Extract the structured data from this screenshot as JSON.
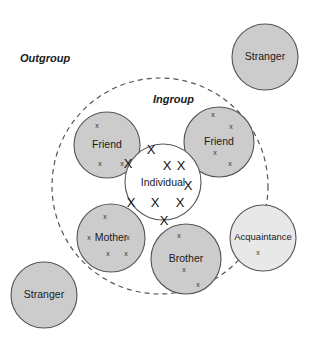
{
  "figure": {
    "background_color": "#ffffff",
    "width": 312,
    "height": 340
  },
  "labels": {
    "outgroup": "Outgroup",
    "ingroup": "Ingroup"
  },
  "boundary": {
    "name": "ingroup-boundary",
    "style": "dashed",
    "stroke_color": "#555555",
    "cx": 160,
    "cy": 186,
    "r": 108
  },
  "center_node": {
    "label": "Individual",
    "fill_color": "#ffffff",
    "stroke_color": "#555555",
    "cx": 163,
    "cy": 182,
    "r": 38,
    "marks": [
      {
        "x": 151,
        "y": 154
      },
      {
        "x": 128,
        "y": 168
      },
      {
        "x": 167,
        "y": 170
      },
      {
        "x": 181,
        "y": 170
      },
      {
        "x": 188,
        "y": 190
      },
      {
        "x": 131,
        "y": 207
      },
      {
        "x": 155,
        "y": 207
      },
      {
        "x": 180,
        "y": 207
      },
      {
        "x": 164,
        "y": 225
      }
    ]
  },
  "nodes": [
    {
      "label": "Friend",
      "name": "friend-left",
      "fill_color": "#cccccc",
      "stroke_color": "#555555",
      "cx": 107,
      "cy": 145,
      "r": 33,
      "label_dy": 3,
      "marks": [
        {
          "x": 97,
          "y": 128
        },
        {
          "x": 100,
          "y": 166
        },
        {
          "x": 122,
          "y": 166
        }
      ]
    },
    {
      "label": "Friend",
      "name": "friend-right",
      "fill_color": "#cccccc",
      "stroke_color": "#555555",
      "cx": 219,
      "cy": 142,
      "r": 35,
      "label_dy": 3,
      "marks": [
        {
          "x": 213,
          "y": 117
        },
        {
          "x": 231,
          "y": 129
        },
        {
          "x": 215,
          "y": 155
        },
        {
          "x": 230,
          "y": 166
        }
      ]
    },
    {
      "label": "Mother",
      "name": "mother",
      "fill_color": "#cccccc",
      "stroke_color": "#555555",
      "cx": 111,
      "cy": 238,
      "r": 34,
      "label_dy": 3,
      "marks": [
        {
          "x": 105,
          "y": 219
        },
        {
          "x": 89,
          "y": 240
        },
        {
          "x": 128,
          "y": 240
        },
        {
          "x": 108,
          "y": 256
        },
        {
          "x": 126,
          "y": 256
        }
      ]
    },
    {
      "label": "Brother",
      "name": "brother",
      "fill_color": "#cccccc",
      "stroke_color": "#555555",
      "cx": 186,
      "cy": 259,
      "r": 35,
      "label_dy": 3,
      "marks": [
        {
          "x": 179,
          "y": 238
        },
        {
          "x": 184,
          "y": 272
        },
        {
          "x": 198,
          "y": 287
        }
      ]
    },
    {
      "label": "Acquaintance",
      "name": "acquaintance",
      "fill_color": "#e8e8e8",
      "stroke_color": "#555555",
      "cx": 263,
      "cy": 238,
      "r": 33,
      "label_dy": 2,
      "small_label": true,
      "marks": [
        {
          "x": 258,
          "y": 255
        }
      ]
    },
    {
      "label": "Stranger",
      "name": "stranger-top-right",
      "fill_color": "#cccccc",
      "stroke_color": "#555555",
      "cx": 265,
      "cy": 57,
      "r": 33,
      "label_dy": 3,
      "marks": []
    },
    {
      "label": "Stranger",
      "name": "stranger-bottom-left",
      "fill_color": "#cccccc",
      "stroke_color": "#555555",
      "cx": 44,
      "cy": 295,
      "r": 33,
      "label_dy": 3,
      "marks": []
    }
  ],
  "label_positions": {
    "outgroup": {
      "x": 20,
      "y": 62
    },
    "ingroup": {
      "x": 153,
      "y": 103
    }
  },
  "mark_glyph": "x",
  "mark_glyph_large": "X"
}
